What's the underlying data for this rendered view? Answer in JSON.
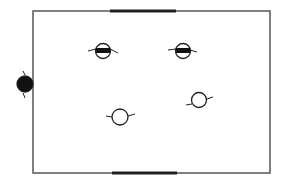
{
  "diagram": {
    "canvas": {
      "width": 283,
      "height": 189,
      "background": "#ffffff"
    },
    "court": {
      "x": 33,
      "y": 11,
      "width": 237,
      "height": 162,
      "stroke": "#555555",
      "stroke_width": 1.5
    },
    "goals": [
      {
        "name": "top-goal",
        "x1": 110,
        "y1": 11,
        "x2": 176,
        "y2": 11,
        "stroke": "#222222",
        "stroke_width": 3
      },
      {
        "name": "bottom-goal",
        "x1": 112,
        "y1": 173,
        "x2": 177,
        "y2": 173,
        "stroke": "#222222",
        "stroke_width": 3
      }
    ],
    "players": [
      {
        "name": "player-filled-sideline",
        "type": "filled",
        "cx": 25,
        "cy": 84,
        "r": 8,
        "arms": [
          [
            23,
            71,
            25,
            75
          ],
          [
            23,
            93,
            25,
            98
          ]
        ]
      },
      {
        "name": "player-banded-left",
        "type": "banded",
        "cx": 103,
        "cy": 51,
        "r": 7.5,
        "arms": [
          [
            88,
            51,
            96,
            49
          ],
          [
            110,
            49,
            118,
            53
          ]
        ]
      },
      {
        "name": "player-banded-right",
        "type": "banded",
        "cx": 183,
        "cy": 51,
        "r": 7.5,
        "arms": [
          [
            168,
            50,
            176,
            49
          ],
          [
            190,
            50,
            197,
            52
          ]
        ]
      },
      {
        "name": "player-open-lower-left",
        "type": "open",
        "cx": 120,
        "cy": 117,
        "r": 8,
        "arms": [
          [
            106,
            116,
            112,
            117
          ],
          [
            128,
            116,
            135,
            114
          ]
        ]
      },
      {
        "name": "player-open-lower-right",
        "type": "open",
        "cx": 199,
        "cy": 100,
        "r": 7.5,
        "arms": [
          [
            186,
            105,
            192,
            104
          ],
          [
            207,
            99,
            213,
            97
          ]
        ]
      }
    ],
    "colors": {
      "ink": "#222222",
      "line": "#555555",
      "fill": "#111111"
    }
  }
}
